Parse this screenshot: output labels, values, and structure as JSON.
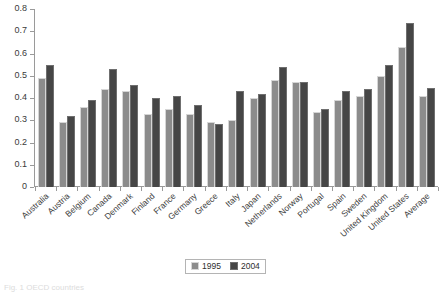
{
  "chart_data": {
    "type": "bar",
    "title": "",
    "xlabel": "",
    "ylabel": "",
    "ylim": [
      0,
      0.8
    ],
    "ytick_step": 0.1,
    "grid": false,
    "legend_position": "bottom-center",
    "ytick_labels": [
      "0.8",
      "0.7",
      "0.6",
      "0.5",
      "0.4",
      "0.3",
      "0.2",
      "0.1",
      "0"
    ],
    "ytick_values": [
      0.8,
      0.7,
      0.6,
      0.5,
      0.4,
      0.3,
      0.2,
      0.1,
      0
    ],
    "categories": [
      "Australia",
      "Austria",
      "Belgium",
      "Canada",
      "Denmark",
      "Finland",
      "France",
      "Germany",
      "Greece",
      "Italy",
      "Japan",
      "Netherlands",
      "Norway",
      "Portugal",
      "Spain",
      "Sweden",
      "United Kingdom",
      "United States",
      "Average"
    ],
    "series": [
      {
        "name": "1995",
        "color": "#8c8c8c",
        "values": [
          0.49,
          0.29,
          0.36,
          0.44,
          0.43,
          0.33,
          0.35,
          0.33,
          0.29,
          0.3,
          0.4,
          0.48,
          0.47,
          0.335,
          0.39,
          0.41,
          0.5,
          0.63,
          0.41
        ]
      },
      {
        "name": "2004",
        "color": "#464646",
        "values": [
          0.55,
          0.32,
          0.39,
          0.53,
          0.46,
          0.4,
          0.41,
          0.37,
          0.285,
          0.43,
          0.42,
          0.54,
          0.47,
          0.35,
          0.43,
          0.44,
          0.55,
          0.735,
          0.445
        ]
      }
    ]
  },
  "legend": {
    "entries": [
      {
        "label": "1995"
      },
      {
        "label": "2004"
      }
    ]
  },
  "caption": {
    "text": "Fig. 1 OECD countries"
  }
}
